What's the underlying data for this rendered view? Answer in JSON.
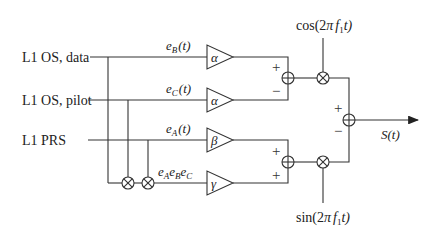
{
  "diagram": {
    "inputs": [
      {
        "id": "data",
        "label": "L1 OS, data"
      },
      {
        "id": "pilot",
        "label": "L1 OS, pilot"
      },
      {
        "id": "prs",
        "label": "L1 PRS"
      }
    ],
    "signals": {
      "eB": "e",
      "eB_sub": "B",
      "eB_arg": "(t)",
      "eC": "e",
      "eC_sub": "C",
      "eC_arg": "(t)",
      "eA": "e",
      "eA_sub": "A",
      "eA_arg": "(t)",
      "product_e1": "e",
      "product_s1": "A",
      "product_e2": "e",
      "product_s2": "B",
      "product_e3": "e",
      "product_s3": "C"
    },
    "gains": {
      "data": "α",
      "pilot": "α",
      "prs": "β",
      "product": "γ"
    },
    "summer_signs": {
      "upper": [
        "+",
        "−"
      ],
      "lower": [
        "+",
        "+"
      ],
      "final": [
        "+",
        "−"
      ]
    },
    "carriers": {
      "cos_pre": "cos(2",
      "cos_pi": "π",
      "cos_f": "f",
      "cos_sub": "1",
      "cos_post": "t)",
      "sin_pre": "sin(2",
      "sin_pi": "π",
      "sin_f": "f",
      "sin_sub": "1",
      "sin_post": "t)"
    },
    "output": {
      "S": "S",
      "arg": "(t)"
    }
  }
}
